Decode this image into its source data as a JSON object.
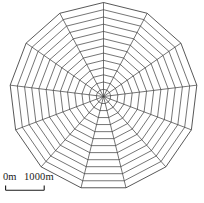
{
  "figure": {
    "kind": "radial-web-map",
    "background_color": "#ffffff",
    "line_color": "#3a3a3a",
    "text_color": "#1a1a1a"
  },
  "scalebar": {
    "name": "map-scale-bar",
    "start_label": "0m",
    "end_label": "1000m",
    "full_text": "0m 1000m",
    "bar_length_px": 40,
    "tick_count": 2
  },
  "chart_data": {
    "type": "radar",
    "title": "",
    "subtitle": "",
    "xlabel": "",
    "ylabel": "",
    "grid": true,
    "legend": "none",
    "spoke_count": 13,
    "ring_count": 13,
    "center": {
      "x": 103.5,
      "y": 96.5
    },
    "outer_radius": 94,
    "start_angle_deg": -90,
    "ring_radii": [
      7.2,
      14.5,
      21.7,
      28.9,
      36.2,
      43.4,
      50.6,
      57.8,
      65.1,
      72.3,
      79.5,
      86.8,
      94.0
    ],
    "ring_labels": [
      "",
      "",
      "",
      "",
      "",
      "",
      "",
      "",
      "",
      "",
      "",
      "",
      ""
    ],
    "categories": [
      "1",
      "2",
      "3",
      "4",
      "5",
      "6",
      "7",
      "8",
      "9",
      "10",
      "11",
      "12",
      "13"
    ],
    "values": [
      94,
      94,
      94,
      94,
      94,
      94,
      94,
      94,
      94,
      94,
      94,
      94,
      94
    ],
    "axis_range": [
      0,
      94
    ],
    "units": "m",
    "scale_min_label": "0m",
    "scale_max_label": "1000m"
  }
}
